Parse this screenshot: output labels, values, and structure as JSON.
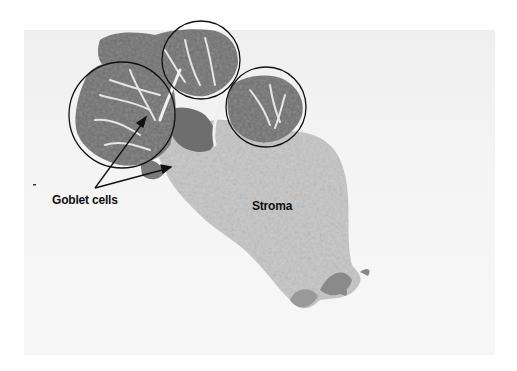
{
  "figure": {
    "labels": {
      "goblet": "Goblet cells",
      "stroma": "Stroma"
    },
    "annotations": {
      "circles": [
        {
          "name": "left-circle",
          "cx": 122,
          "cy": 115,
          "r": 53
        },
        {
          "name": "top-circle",
          "cx": 201,
          "cy": 60,
          "r": 39
        },
        {
          "name": "right-circle",
          "cx": 266,
          "cy": 107,
          "r": 40
        }
      ],
      "arrows": [
        {
          "name": "arrow-to-goblet-upper",
          "from": [
            95,
            188
          ],
          "to": [
            146,
            118
          ]
        },
        {
          "name": "arrow-to-goblet-lower",
          "from": [
            95,
            188
          ],
          "to": [
            170,
            168
          ]
        }
      ]
    },
    "colors": {
      "background": "#ffffff",
      "slide": "#f2f2f2",
      "epithelium": "#6b6b6b",
      "stroma": "#bdbdbd",
      "annotation": "#111111"
    }
  }
}
